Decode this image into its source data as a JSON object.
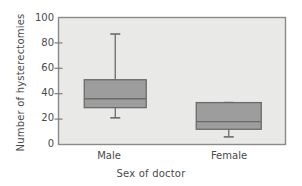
{
  "chart_data": {
    "type": "box",
    "title": "",
    "xlabel": "Sex of doctor",
    "ylabel": "Number of hysterectomies",
    "ylim": [
      0,
      100
    ],
    "yticks": [
      0,
      20,
      40,
      60,
      80,
      100
    ],
    "categories": [
      "Male",
      "Female"
    ],
    "grid": false,
    "legend": "none",
    "plot_background": "#e9e9e7",
    "box_fill": "#9d9d9d",
    "box_stroke": "#6b6b6b",
    "series": [
      {
        "name": "Male",
        "whisker_low": 21,
        "q1": 29,
        "median": 36,
        "q3": 51,
        "whisker_high": 87
      },
      {
        "name": "Female",
        "whisker_low": 6,
        "q1": 12,
        "median": 18,
        "q3": 33,
        "whisker_high": 33
      }
    ]
  },
  "axes": {
    "y_tick_labels": [
      "100",
      "80",
      "60",
      "40",
      "20",
      "0"
    ],
    "x_tick_labels": [
      "Male",
      "Female"
    ]
  }
}
